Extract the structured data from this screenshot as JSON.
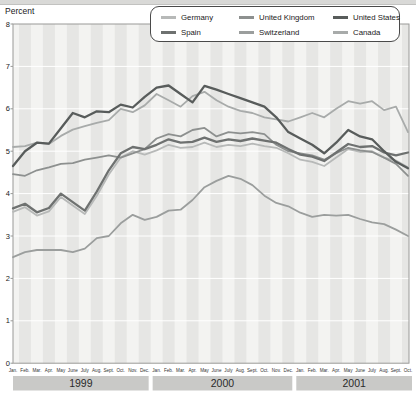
{
  "chart_data": {
    "type": "line",
    "ylabel": "Percent",
    "ylim": [
      0,
      8
    ],
    "yticks": [
      0,
      1,
      2,
      3,
      4,
      5,
      6,
      7,
      8
    ],
    "grid": "on",
    "legend_position": "top",
    "categories": [
      "Jan.",
      "Feb.",
      "Mar.",
      "Apr.",
      "May",
      "June",
      "July",
      "Aug.",
      "Sept.",
      "Oct.",
      "Nov.",
      "Dec.",
      "Jan.",
      "Feb.",
      "Mar.",
      "Apr.",
      "May",
      "June",
      "July",
      "Aug.",
      "Sept.",
      "Oct.",
      "Nov.",
      "Dec.",
      "Jan.",
      "Feb.",
      "Mar.",
      "Apr.",
      "May",
      "June",
      "July",
      "Aug.",
      "Sept.",
      "Oct."
    ],
    "year_bands": [
      {
        "label": "1999",
        "months": 12
      },
      {
        "label": "2000",
        "months": 12
      },
      {
        "label": "2001",
        "months": 10
      }
    ],
    "series": [
      {
        "name": "Germany",
        "color": "#b7b9b8",
        "width": 1.8,
        "values": [
          3.57,
          3.68,
          3.48,
          3.58,
          3.92,
          3.72,
          3.52,
          3.95,
          4.45,
          4.85,
          5.0,
          4.92,
          5.02,
          5.15,
          5.08,
          5.1,
          5.2,
          5.1,
          5.15,
          5.12,
          5.18,
          5.12,
          5.08,
          4.95,
          4.8,
          4.75,
          4.65,
          4.85,
          5.05,
          4.98,
          5.0,
          4.85,
          4.78,
          4.62
        ]
      },
      {
        "name": "United Kingdom",
        "color": "#8d908f",
        "width": 1.8,
        "values": [
          4.46,
          4.42,
          4.55,
          4.62,
          4.7,
          4.72,
          4.8,
          4.85,
          4.9,
          4.85,
          4.95,
          5.05,
          5.3,
          5.4,
          5.35,
          5.5,
          5.55,
          5.35,
          5.45,
          5.42,
          5.45,
          5.4,
          5.15,
          5.0,
          4.95,
          4.9,
          4.8,
          4.95,
          5.08,
          5.02,
          4.98,
          4.85,
          4.7,
          4.42
        ]
      },
      {
        "name": "United States",
        "color": "#585c5b",
        "width": 2.3,
        "values": [
          4.65,
          5.0,
          5.2,
          5.18,
          5.54,
          5.9,
          5.8,
          5.94,
          5.92,
          6.1,
          6.03,
          6.28,
          6.5,
          6.55,
          6.35,
          6.15,
          6.54,
          6.45,
          6.35,
          6.25,
          6.15,
          6.05,
          5.8,
          5.45,
          5.3,
          5.15,
          4.95,
          5.2,
          5.5,
          5.35,
          5.28,
          5.0,
          4.75,
          4.6
        ]
      },
      {
        "name": "Spain",
        "color": "#6e7170",
        "width": 2.3,
        "values": [
          3.65,
          3.76,
          3.56,
          3.66,
          4.0,
          3.8,
          3.6,
          4.05,
          4.55,
          4.95,
          5.1,
          5.05,
          5.15,
          5.28,
          5.2,
          5.22,
          5.32,
          5.22,
          5.28,
          5.24,
          5.3,
          5.25,
          5.2,
          5.05,
          4.92,
          4.87,
          4.77,
          4.97,
          5.17,
          5.1,
          5.12,
          4.97,
          4.9,
          4.97
        ]
      },
      {
        "name": "Switzerland",
        "color": "#9b9e9d",
        "width": 1.8,
        "values": [
          2.5,
          2.62,
          2.67,
          2.67,
          2.67,
          2.62,
          2.7,
          2.95,
          3.0,
          3.3,
          3.5,
          3.38,
          3.45,
          3.6,
          3.62,
          3.85,
          4.15,
          4.3,
          4.42,
          4.35,
          4.2,
          3.95,
          3.78,
          3.7,
          3.55,
          3.45,
          3.5,
          3.48,
          3.5,
          3.4,
          3.32,
          3.28,
          3.15,
          3.0
        ]
      },
      {
        "name": "Canada",
        "color": "#a8abaa",
        "width": 1.8,
        "values": [
          5.1,
          5.12,
          5.2,
          5.17,
          5.36,
          5.51,
          5.59,
          5.67,
          5.73,
          6.0,
          5.92,
          6.08,
          6.35,
          6.2,
          6.05,
          6.3,
          6.4,
          6.2,
          6.05,
          5.95,
          5.9,
          5.8,
          5.75,
          5.7,
          5.8,
          5.9,
          5.8,
          6.0,
          6.18,
          6.12,
          6.18,
          5.97,
          6.05,
          5.45
        ]
      }
    ],
    "colors": {
      "plot_bg": "#f3f3f1",
      "stripe": "#e6e6e4",
      "gridline": "#ffffff",
      "plot_border": "#9a9a98",
      "year_band_bg": "#c9c9c7",
      "axis_text": "#1a1a1a"
    }
  }
}
